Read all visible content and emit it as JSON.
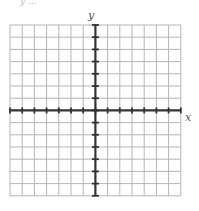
{
  "chart_data": {
    "type": "coordinate-grid",
    "title": "",
    "xlabel": "x",
    "ylabel": "y",
    "xlim": [
      -7,
      7
    ],
    "ylim": [
      -7,
      7
    ],
    "grid": true,
    "tick_marks_every": 1,
    "tick_labels": [],
    "series": []
  },
  "labels": {
    "x_axis": "x",
    "y_axis": "y",
    "top_fragment": "y ..."
  },
  "colors": {
    "grid_line": "#b5b5b5",
    "axis_line": "#333333",
    "label": "#555555"
  },
  "grid": {
    "left": 10,
    "top": 25,
    "cell": 12.2,
    "cols": 14,
    "rows": 14,
    "origin_col": 7,
    "origin_row": 7
  }
}
